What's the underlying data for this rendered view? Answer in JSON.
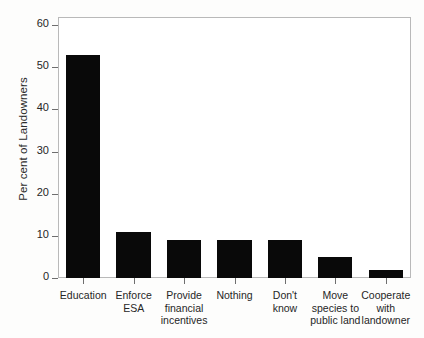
{
  "chart_data": {
    "type": "bar",
    "title": "",
    "subtitle": "",
    "xlabel": "",
    "ylabel": "Per cent of Landowners",
    "categories": [
      "Education",
      "Enforce ESA",
      "Provide financial incentives",
      "Nothing",
      "Don't know",
      "Move species to public land",
      "Cooperate with landowner"
    ],
    "category_lines": [
      "Education",
      "Enforce\nESA",
      "Provide\nfinancial\nincentives",
      "Nothing",
      "Don't know",
      "Move\nspecies to\npublic land",
      "Cooperate\nwith\nlandowner"
    ],
    "values": [
      53,
      11,
      9,
      9,
      9,
      5,
      2
    ],
    "ylim": [
      0,
      60
    ],
    "yticks": [
      0,
      10,
      20,
      30,
      40,
      50,
      60
    ],
    "ytick_labels": [
      "0",
      "10",
      "20",
      "30",
      "40",
      "50",
      "60"
    ],
    "grid": false,
    "legend": null,
    "bar_color": "#090909",
    "frame_color": "#b9b9b9",
    "background": "#ffffff"
  }
}
